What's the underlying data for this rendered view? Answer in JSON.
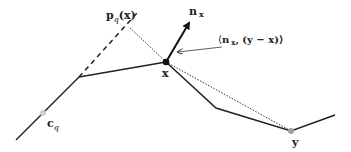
{
  "diagram": {
    "points": {
      "x": {
        "label": "x",
        "pos": [
          166,
          62
        ],
        "color": "#111111"
      },
      "y": {
        "label": "y",
        "pos": [
          291,
          131
        ],
        "color": "#a0a0a0"
      },
      "c_q": {
        "label_main": "c",
        "label_sub": "q",
        "pos": [
          43,
          113
        ],
        "color": "#c8c8c8"
      },
      "p_q_x": {
        "label_main": "p",
        "label_sub": "q",
        "label_arg": "(x)",
        "pos": [
          129,
          27
        ]
      }
    },
    "normal": {
      "label_main": "n",
      "label_sub": "x"
    },
    "inner_product": {
      "label_open": "⟨",
      "label_n": "n",
      "label_sub": "x",
      "label_rest": ", (y − x)⟩"
    },
    "colors": {
      "line": "#222222",
      "dotted": "#333333",
      "background": "#ffffff"
    }
  }
}
